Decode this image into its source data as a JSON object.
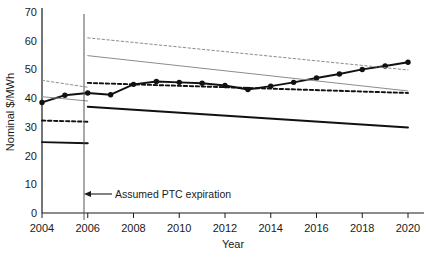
{
  "chart_data": {
    "type": "line",
    "title": "",
    "xlabel": "Year",
    "ylabel": "Nominal $/MWh",
    "xlim": [
      2004,
      2020
    ],
    "ylim": [
      0,
      70
    ],
    "grid": false,
    "legend": "none",
    "x_ticks": [
      2004,
      2006,
      2008,
      2010,
      2012,
      2014,
      2016,
      2018,
      2020
    ],
    "x_tick_labels": [
      "2004",
      "2006",
      "2008",
      "2010",
      "2012",
      "2014",
      "2016",
      "2018",
      "2020"
    ],
    "y_ticks": [
      0,
      10,
      20,
      30,
      40,
      50,
      60,
      70
    ],
    "y_tick_labels": [
      "0",
      "10",
      "20",
      "30",
      "40",
      "50",
      "60",
      "70"
    ],
    "annotations": [
      {
        "text": "Assumed PTC expiration",
        "x": 2006,
        "y": 7,
        "style": "arrow-left",
        "marker_line_x": 2006
      }
    ],
    "series": [
      {
        "name": "markers-series",
        "style": "solid-black-markers",
        "color": "#111111",
        "markers": true,
        "x": [
          2004,
          2005,
          2006,
          2007,
          2008,
          2009,
          2010,
          2011,
          2012,
          2013,
          2014,
          2015,
          2016,
          2017,
          2018,
          2019,
          2020
        ],
        "values": [
          38.5,
          41.0,
          41.8,
          41.2,
          44.8,
          45.8,
          45.5,
          45.2,
          44.4,
          43.0,
          44.2,
          45.5,
          47.0,
          48.4,
          50.0,
          51.2,
          52.5
        ]
      },
      {
        "name": "black-dashed-upper",
        "style": "dashed-black",
        "color": "#111111",
        "markers": false,
        "x": [
          2006,
          2020
        ],
        "values": [
          45.3,
          41.8
        ]
      },
      {
        "name": "black-dashed-lower-pre",
        "style": "dashed-black",
        "color": "#111111",
        "markers": false,
        "x": [
          2004,
          2006
        ],
        "values": [
          32.2,
          31.8
        ]
      },
      {
        "name": "black-solid-lower",
        "style": "solid-black",
        "color": "#111111",
        "markers": false,
        "x": [
          2006,
          2020
        ],
        "values": [
          37.0,
          29.8
        ]
      },
      {
        "name": "black-solid-lower-pre",
        "style": "solid-black",
        "color": "#111111",
        "markers": false,
        "x": [
          2004,
          2006
        ],
        "values": [
          24.7,
          24.3
        ]
      },
      {
        "name": "gray-dashed-upper",
        "style": "dashed-gray",
        "color": "#8c8c8c",
        "markers": false,
        "x": [
          2006,
          2020
        ],
        "values": [
          61.0,
          49.8
        ]
      },
      {
        "name": "gray-dashed-pre",
        "style": "dashed-gray",
        "color": "#8c8c8c",
        "markers": false,
        "x": [
          2004,
          2006
        ],
        "values": [
          46.2,
          43.8
        ]
      },
      {
        "name": "gray-solid-mid",
        "style": "solid-gray",
        "color": "#8c8c8c",
        "markers": false,
        "x": [
          2006,
          2020
        ],
        "values": [
          54.8,
          42.5
        ]
      },
      {
        "name": "gray-solid-pre",
        "style": "solid-gray",
        "color": "#8c8c8c",
        "markers": false,
        "x": [
          2004,
          2006
        ],
        "values": [
          40.5,
          39.0
        ]
      }
    ]
  }
}
